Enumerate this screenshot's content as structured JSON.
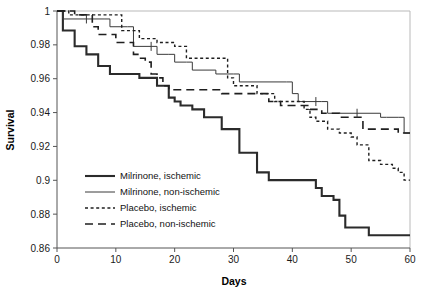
{
  "chart_data": {
    "type": "line",
    "title": "",
    "subtitle": "",
    "xlabel": "Days",
    "ylabel": "Survival",
    "xlim": [
      0,
      60
    ],
    "ylim": [
      0.86,
      1
    ],
    "xticks": [
      0,
      10,
      20,
      30,
      40,
      50,
      60
    ],
    "xtick_labels": [
      "0",
      "10",
      "20",
      "30",
      "40",
      "50",
      "60"
    ],
    "yticks": [
      0.86,
      0.88,
      0.9,
      0.92,
      0.94,
      0.96,
      0.98,
      1
    ],
    "ytick_labels": [
      "0.86",
      "0.88",
      "0.9",
      "0.92",
      "0.94",
      "0.96",
      "0.98",
      "1"
    ],
    "grid": false,
    "legend_position": "lower-left-inside",
    "curve_style": "kaplan-meier-step",
    "series": [
      {
        "name": "Milrinone, ischemic",
        "line_style": "solid",
        "line_width": 2.1,
        "color": "#2b2b2b",
        "points": [
          [
            0,
            1.0
          ],
          [
            1,
            0.9885
          ],
          [
            3,
            0.9792
          ],
          [
            5,
            0.9744
          ],
          [
            7,
            0.9675
          ],
          [
            9,
            0.9628
          ],
          [
            13,
            0.9628
          ],
          [
            14,
            0.9605
          ],
          [
            16,
            0.9605
          ],
          [
            17,
            0.9558
          ],
          [
            18,
            0.9558
          ],
          [
            19,
            0.9488
          ],
          [
            20,
            0.9465
          ],
          [
            21,
            0.9442
          ],
          [
            23,
            0.9419
          ],
          [
            25,
            0.9372
          ],
          [
            27,
            0.9372
          ],
          [
            28,
            0.9302
          ],
          [
            30,
            0.9302
          ],
          [
            31,
            0.9163
          ],
          [
            33,
            0.9163
          ],
          [
            34,
            0.9047
          ],
          [
            36,
            0.9001
          ],
          [
            43,
            0.9001
          ],
          [
            44,
            0.8954
          ],
          [
            45,
            0.8907
          ],
          [
            46,
            0.8907
          ],
          [
            47,
            0.8884
          ],
          [
            48,
            0.8791
          ],
          [
            49,
            0.8721
          ],
          [
            52,
            0.8721
          ],
          [
            53,
            0.8675
          ],
          [
            60,
            0.8675
          ]
        ],
        "censor_marks": []
      },
      {
        "name": "Milrinone, non-ischemic",
        "line_style": "solid",
        "line_width": 1.0,
        "color": "#3a3a3a",
        "points": [
          [
            0,
            1.0
          ],
          [
            1,
            0.9953
          ],
          [
            8,
            0.9953
          ],
          [
            9,
            0.9907
          ],
          [
            12,
            0.9907
          ],
          [
            13,
            0.9791
          ],
          [
            16,
            0.9791
          ],
          [
            17,
            0.9744
          ],
          [
            19,
            0.9744
          ],
          [
            20,
            0.9698
          ],
          [
            22,
            0.9698
          ],
          [
            23,
            0.9651
          ],
          [
            26,
            0.9651
          ],
          [
            27,
            0.9628
          ],
          [
            30,
            0.9628
          ],
          [
            31,
            0.9581
          ],
          [
            39,
            0.9581
          ],
          [
            40,
            0.9512
          ],
          [
            41,
            0.9465
          ],
          [
            45,
            0.9465
          ],
          [
            46,
            0.9396
          ],
          [
            55,
            0.9372
          ],
          [
            56,
            0.9372
          ],
          [
            58,
            0.9372
          ],
          [
            59,
            0.9279
          ],
          [
            60,
            0.9279
          ]
        ],
        "censor_marks": [
          [
            5,
            0.9953
          ],
          [
            16,
            0.9791
          ],
          [
            44,
            0.9465
          ],
          [
            51,
            0.9396
          ]
        ]
      },
      {
        "name": "Placebo, ischemic",
        "line_style": "dotted",
        "line_width": 1.4,
        "color": "#1f1f1f",
        "points": [
          [
            0,
            1.0
          ],
          [
            2,
            0.9977
          ],
          [
            10,
            0.9977
          ],
          [
            11,
            0.9884
          ],
          [
            13,
            0.9884
          ],
          [
            14,
            0.9837
          ],
          [
            16,
            0.9837
          ],
          [
            17,
            0.9814
          ],
          [
            19,
            0.9814
          ],
          [
            20,
            0.9791
          ],
          [
            22,
            0.9721
          ],
          [
            23,
            0.9721
          ],
          [
            28,
            0.9721
          ],
          [
            29,
            0.9605
          ],
          [
            30,
            0.9558
          ],
          [
            33,
            0.9558
          ],
          [
            34,
            0.9512
          ],
          [
            36,
            0.9512
          ],
          [
            37,
            0.9465
          ],
          [
            41,
            0.9465
          ],
          [
            42,
            0.9419
          ],
          [
            43,
            0.9372
          ],
          [
            44,
            0.9349
          ],
          [
            46,
            0.9302
          ],
          [
            48,
            0.9279
          ],
          [
            50,
            0.9256
          ],
          [
            51,
            0.9209
          ],
          [
            53,
            0.9117
          ],
          [
            55,
            0.9094
          ],
          [
            57,
            0.9071
          ],
          [
            58,
            0.9047
          ],
          [
            59,
            0.9001
          ],
          [
            60,
            0.9001
          ]
        ],
        "censor_marks": []
      },
      {
        "name": "Placebo, non-ischemic",
        "line_style": "dashed",
        "line_width": 1.6,
        "color": "#1f1f1f",
        "points": [
          [
            0,
            1.0
          ],
          [
            3,
            0.9977
          ],
          [
            5,
            0.9977
          ],
          [
            6,
            0.9907
          ],
          [
            7,
            0.9861
          ],
          [
            9,
            0.9861
          ],
          [
            10,
            0.9814
          ],
          [
            12,
            0.9814
          ],
          [
            13,
            0.9744
          ],
          [
            14,
            0.9721
          ],
          [
            15,
            0.9698
          ],
          [
            16,
            0.9628
          ],
          [
            17,
            0.9605
          ],
          [
            18,
            0.9558
          ],
          [
            19,
            0.9535
          ],
          [
            27,
            0.9535
          ],
          [
            28,
            0.9512
          ],
          [
            30,
            0.9512
          ],
          [
            31,
            0.9512
          ],
          [
            33,
            0.9512
          ],
          [
            34,
            0.9512
          ],
          [
            35,
            0.9512
          ],
          [
            36,
            0.9465
          ],
          [
            38,
            0.9442
          ],
          [
            42,
            0.9442
          ],
          [
            43,
            0.9419
          ],
          [
            45,
            0.9396
          ],
          [
            47,
            0.9396
          ],
          [
            48,
            0.9372
          ],
          [
            51,
            0.9372
          ],
          [
            52,
            0.9302
          ],
          [
            57,
            0.9302
          ],
          [
            58,
            0.9279
          ],
          [
            60,
            0.9279
          ]
        ],
        "censor_marks": []
      }
    ],
    "legend_entries": [
      {
        "label": "Milrinone, ischemic",
        "line_style": "solid",
        "line_width": 2.1,
        "color": "#2b2b2b"
      },
      {
        "label": "Milrinone, non-ischemic",
        "line_style": "solid",
        "line_width": 1.0,
        "color": "#3a3a3a"
      },
      {
        "label": "Placebo, ischemic",
        "line_style": "dotted",
        "line_width": 1.4,
        "color": "#1f1f1f"
      },
      {
        "label": "Placebo, non-ischemic",
        "line_style": "dashed",
        "line_width": 1.6,
        "color": "#1f1f1f"
      }
    ]
  },
  "layout": {
    "plot_left": 57,
    "plot_right": 410,
    "plot_top": 11,
    "plot_bottom": 248,
    "legend_x": 85,
    "legend_y_start": 176,
    "legend_row_height": 16,
    "legend_line_length": 30,
    "legend_text_gap": 5
  },
  "colors": {
    "background": "#ffffff",
    "axis": "#555555",
    "frame": "#b9b9b9",
    "text": "#1a1a1a"
  }
}
